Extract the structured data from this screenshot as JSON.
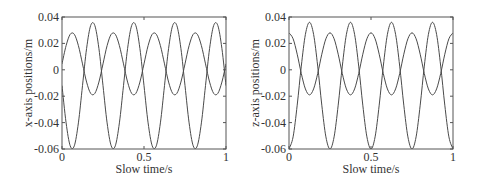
{
  "chart_data": [
    {
      "type": "line",
      "title": "",
      "xlabel": "Slow time/s",
      "ylabel": "x-axis positions/m",
      "xlim": [
        0,
        1
      ],
      "ylim": [
        -0.06,
        0.04
      ],
      "xticks": [
        0,
        0.5,
        1
      ],
      "xtick_labels": [
        "0",
        "0.5",
        "1"
      ],
      "yticks": [
        0.04,
        0.02,
        0,
        -0.02,
        -0.04,
        -0.06
      ],
      "ytick_labels": [
        "0.04",
        "0.02",
        "0",
        "-0.02",
        "-0.04",
        "-0.06"
      ],
      "grid": false,
      "legend": null,
      "x": [
        0,
        0.025,
        0.05,
        0.075,
        0.1,
        0.125,
        0.15,
        0.175,
        0.2,
        0.225,
        0.25,
        0.275,
        0.3,
        0.325,
        0.35,
        0.375,
        0.4,
        0.425,
        0.45,
        0.475,
        0.5,
        0.525,
        0.55,
        0.575,
        0.6,
        0.625,
        0.65,
        0.675,
        0.7,
        0.725,
        0.75,
        0.775,
        0.8,
        0.825,
        0.85,
        0.875,
        0.9,
        0.925,
        0.95,
        0.975,
        1.0
      ],
      "series": [
        {
          "name": "large-amplitude",
          "color": "#4a4a4a",
          "values": [
            -0.012,
            -0.0402,
            -0.0576,
            -0.0576,
            -0.0402,
            -0.012,
            0.0162,
            0.0336,
            0.0336,
            0.0162,
            -0.012,
            -0.0402,
            -0.0576,
            -0.0576,
            -0.0402,
            -0.012,
            0.0162,
            0.0336,
            0.0336,
            0.0162,
            -0.012,
            -0.0402,
            -0.0576,
            -0.0576,
            -0.0402,
            -0.012,
            0.0162,
            0.0336,
            0.0336,
            0.0162,
            -0.012,
            -0.0402,
            -0.0576,
            -0.0576,
            -0.0402,
            -0.012,
            0.0162,
            0.0336,
            0.0336,
            0.0162,
            -0.012
          ]
        },
        {
          "name": "small-amplitude",
          "color": "#4a4a4a",
          "values": [
            0.0045,
            0.0183,
            0.0269,
            0.0269,
            0.0183,
            0.0045,
            -0.0093,
            -0.0179,
            -0.0179,
            -0.0093,
            0.0045,
            0.0183,
            0.0269,
            0.0269,
            0.0183,
            0.0045,
            -0.0093,
            -0.0179,
            -0.0179,
            -0.0093,
            0.0045,
            0.0183,
            0.0269,
            0.0269,
            0.0183,
            0.0045,
            -0.0093,
            -0.0179,
            -0.0179,
            -0.0093,
            0.0045,
            0.0183,
            0.0269,
            0.0269,
            0.0183,
            0.0045,
            -0.0093,
            -0.0179,
            -0.0179,
            -0.0093,
            0.0045
          ]
        }
      ]
    },
    {
      "type": "line",
      "title": "",
      "xlabel": "Slow time/s",
      "ylabel": "z-axis positions/m",
      "xlim": [
        0,
        1
      ],
      "ylim": [
        -0.06,
        0.04
      ],
      "xticks": [
        0,
        0.5,
        1
      ],
      "xtick_labels": [
        "0",
        "0.5",
        "1"
      ],
      "yticks": [
        0.04,
        0.02,
        0,
        -0.02,
        -0.04,
        -0.06
      ],
      "ytick_labels": [
        "0.04",
        "0.02",
        "0",
        "-0.02",
        "-0.04",
        "-0.06"
      ],
      "grid": false,
      "legend": null,
      "x": [
        0,
        0.025,
        0.05,
        0.075,
        0.1,
        0.125,
        0.15,
        0.175,
        0.2,
        0.225,
        0.25,
        0.275,
        0.3,
        0.325,
        0.35,
        0.375,
        0.4,
        0.425,
        0.45,
        0.475,
        0.5,
        0.525,
        0.55,
        0.575,
        0.6,
        0.625,
        0.65,
        0.675,
        0.7,
        0.725,
        0.75,
        0.775,
        0.8,
        0.825,
        0.85,
        0.875,
        0.9,
        0.925,
        0.95,
        0.975,
        1.0
      ],
      "series": [
        {
          "name": "large-amplitude",
          "color": "#4a4a4a",
          "values": [
            -0.06,
            -0.0508,
            -0.0268,
            0.0028,
            0.0268,
            0.036,
            0.0268,
            0.0028,
            -0.0268,
            -0.0508,
            -0.06,
            -0.0508,
            -0.0268,
            0.0028,
            0.0268,
            0.036,
            0.0268,
            0.0028,
            -0.0268,
            -0.0508,
            -0.06,
            -0.0508,
            -0.0268,
            0.0028,
            0.0268,
            0.036,
            0.0268,
            0.0028,
            -0.0268,
            -0.0508,
            -0.06,
            -0.0508,
            -0.0268,
            0.0028,
            0.0268,
            0.036,
            0.0268,
            0.0028,
            -0.0268,
            -0.0508,
            -0.06
          ]
        },
        {
          "name": "small-amplitude",
          "color": "#4a4a4a",
          "values": [
            0.028,
            0.0235,
            0.0118,
            -0.0028,
            -0.0145,
            -0.019,
            -0.0145,
            -0.0028,
            0.0118,
            0.0235,
            0.028,
            0.0235,
            0.0118,
            -0.0028,
            -0.0145,
            -0.019,
            -0.0145,
            -0.0028,
            0.0118,
            0.0235,
            0.028,
            0.0235,
            0.0118,
            -0.0028,
            -0.0145,
            -0.019,
            -0.0145,
            -0.0028,
            0.0118,
            0.0235,
            0.028,
            0.0235,
            0.0118,
            -0.0028,
            -0.0145,
            -0.019,
            -0.0145,
            -0.0028,
            0.0118,
            0.0235,
            0.028
          ]
        }
      ]
    }
  ]
}
